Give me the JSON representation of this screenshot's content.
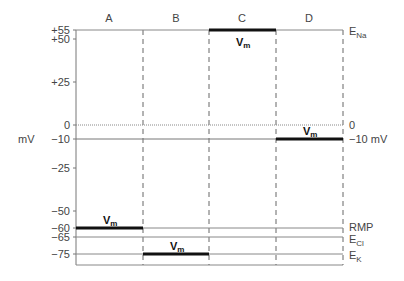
{
  "diagram": {
    "y_axis_unit": "mV",
    "columns": [
      "A",
      "B",
      "C",
      "D"
    ],
    "ticks": [
      {
        "value": 55,
        "label": "+55"
      },
      {
        "value": 50,
        "label": "+50"
      },
      {
        "value": 25,
        "label": "+25"
      },
      {
        "value": 0,
        "label": "0"
      },
      {
        "value": -10,
        "label": "−10"
      },
      {
        "value": -25,
        "label": "−25"
      },
      {
        "value": -50,
        "label": "−50"
      },
      {
        "value": -60,
        "label": "−60"
      },
      {
        "value": -65,
        "label": "−65"
      },
      {
        "value": -75,
        "label": "−75"
      }
    ],
    "right_labels": {
      "ena_main": "E",
      "ena_sub": "Na",
      "zero": "0",
      "minus10": "−10 mV",
      "rmp": "RMP",
      "ecl_main": "E",
      "ecl_sub": "Cl",
      "ek_main": "E",
      "ek_sub": "K"
    },
    "vm_label_main": "V",
    "vm_label_sub": "m",
    "membrane_potentials": [
      {
        "column": "A",
        "value": -60
      },
      {
        "column": "B",
        "value": -75
      },
      {
        "column": "C",
        "value": 55
      },
      {
        "column": "D",
        "value": -10
      }
    ]
  }
}
